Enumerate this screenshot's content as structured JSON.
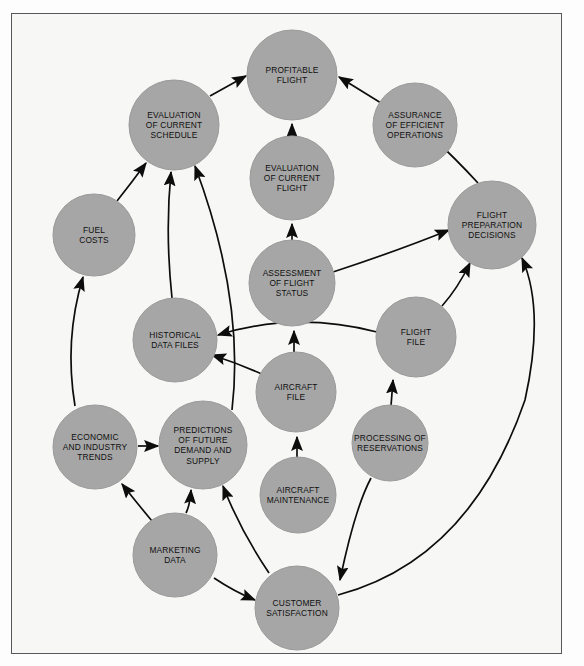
{
  "diagram": {
    "style": {
      "page_background": "#ffffff",
      "frame_background": "#f7f7f5",
      "frame_border": "#58585a",
      "node_fill": "#a6a6a6",
      "node_stroke": "#9a9a9a",
      "arrow_color": "#0d0d0d",
      "label_color": "#101010"
    },
    "nodes": [
      {
        "id": "profitable-flight",
        "label": "PROFITABLE\nFLIGHT",
        "cx": 292,
        "cy": 75,
        "r": 45
      },
      {
        "id": "evaluation-of-current-schedule",
        "label": "EVALUATION\nOF CURRENT\nSCHEDULE",
        "cx": 174,
        "cy": 125,
        "r": 45
      },
      {
        "id": "assurance-of-efficient-operations",
        "label": "ASSURANCE\nOF EFFICIENT\nOPERATIONS",
        "cx": 415,
        "cy": 125,
        "r": 42
      },
      {
        "id": "evaluation-of-current-flight",
        "label": "EVALUATION\nOF CURRENT\nFLIGHT",
        "cx": 292,
        "cy": 178,
        "r": 42
      },
      {
        "id": "fuel-costs",
        "label": "FUEL\nCOSTS",
        "cx": 94,
        "cy": 235,
        "r": 41
      },
      {
        "id": "flight-preparation-decisions",
        "label": "FLIGHT\nPREPARATION\nDECISIONS",
        "cx": 492,
        "cy": 225,
        "r": 44
      },
      {
        "id": "assessment-of-flight-status",
        "label": "ASSESSMENT\nOF FLIGHT\nSTATUS",
        "cx": 292,
        "cy": 283,
        "r": 43
      },
      {
        "id": "historical-data-files",
        "label": "HISTORICAL\nDATA FILES",
        "cx": 175,
        "cy": 340,
        "r": 42
      },
      {
        "id": "flight-file",
        "label": "FLIGHT\nFILE",
        "cx": 416,
        "cy": 337,
        "r": 40
      },
      {
        "id": "aircraft-file",
        "label": "AIRCRAFT\nFILE",
        "cx": 296,
        "cy": 392,
        "r": 40
      },
      {
        "id": "economic-and-industry-trends",
        "label": "ECONOMIC\nAND INDUSTRY\nTRENDS",
        "cx": 95,
        "cy": 447,
        "r": 42
      },
      {
        "id": "predictions-of-future-demand-and-supply",
        "label": "PREDICTIONS\nOF FUTURE\nDEMAND AND\nSUPPLY",
        "cx": 203,
        "cy": 445,
        "r": 44
      },
      {
        "id": "processing-of-reservations",
        "label": "PROCESSING OF\nRESERVATIONS",
        "cx": 390,
        "cy": 443,
        "r": 38
      },
      {
        "id": "aircraft-maintenance",
        "label": "AIRCRAFT\nMAINTENANCE",
        "cx": 298,
        "cy": 495,
        "r": 38
      },
      {
        "id": "marketing-data",
        "label": "MARKETING\nDATA",
        "cx": 175,
        "cy": 555,
        "r": 42
      },
      {
        "id": "customer-satisfaction",
        "label": "CUSTOMER\nSATISFACTION",
        "cx": 297,
        "cy": 608,
        "r": 42
      }
    ],
    "edges": [
      {
        "from": "evaluation-of-current-schedule",
        "to": "profitable-flight",
        "path": "M 210 96 Q 228 86 246 76"
      },
      {
        "from": "assurance-of-efficient-operations",
        "to": "profitable-flight",
        "path": "M 381 103 Q 360 90 339 77"
      },
      {
        "from": "evaluation-of-current-flight",
        "to": "profitable-flight",
        "path": "M 292 136 L 292 124"
      },
      {
        "from": "assessment-of-flight-status",
        "to": "evaluation-of-current-flight",
        "path": "M 292 240 L 292 224"
      },
      {
        "from": "fuel-costs",
        "to": "evaluation-of-current-schedule",
        "path": "M 117 201 Q 132 182 146 163"
      },
      {
        "from": "historical-data-files",
        "to": "evaluation-of-current-schedule",
        "path": "M 172 298 Q 165 232 171 172"
      },
      {
        "from": "predictions-of-future-demand-and-supply",
        "to": "evaluation-of-current-schedule",
        "path": "M 232 410 Q 245 300 195 166"
      },
      {
        "from": "assessment-of-flight-status",
        "to": "flight-preparation-decisions",
        "path": "M 333 272 Q 400 250 449 230"
      },
      {
        "from": "flight-preparation-decisions",
        "to": "assurance-of-efficient-operations",
        "path": "M 478 183 Q 455 158 432 137"
      },
      {
        "from": "flight-file",
        "to": "flight-preparation-decisions",
        "path": "M 442 306 Q 458 288 470 263"
      },
      {
        "from": "flight-file",
        "to": "historical-data-files",
        "path": "M 377 332 Q 295 311 218 335"
      },
      {
        "from": "aircraft-file",
        "to": "historical-data-files",
        "path": "M 266 376 Q 240 364 212 355"
      },
      {
        "from": "aircraft-file",
        "to": "assessment-of-flight-status",
        "path": "M 294 352 L 294 331"
      },
      {
        "from": "economic-and-industry-trends",
        "to": "fuel-costs",
        "path": "M 75 406 Q 64 340 83 277"
      },
      {
        "from": "economic-and-industry-trends",
        "to": "predictions-of-future-demand-and-supply",
        "path": "M 138 446 L 158 446"
      },
      {
        "from": "marketing-data",
        "to": "economic-and-industry-trends",
        "path": "M 152 521 Q 137 503 122 484"
      },
      {
        "from": "marketing-data",
        "to": "predictions-of-future-demand-and-supply",
        "path": "M 186 513 Q 190 505 191 490"
      },
      {
        "from": "marketing-data",
        "to": "customer-satisfaction",
        "path": "M 214 578 Q 235 592 255 600"
      },
      {
        "from": "customer-satisfaction",
        "to": "predictions-of-future-demand-and-supply",
        "path": "M 269 573 Q 240 530 223 486"
      },
      {
        "from": "aircraft-maintenance",
        "to": "aircraft-file",
        "path": "M 297 460 L 297 437"
      },
      {
        "from": "processing-of-reservations",
        "to": "flight-file",
        "path": "M 391 406 L 393 380"
      },
      {
        "from": "processing-of-reservations",
        "to": "customer-satisfaction",
        "path": "M 371 478 Q 355 508 340 580"
      },
      {
        "from": "customer-satisfaction",
        "to": "flight-preparation-decisions",
        "path": "M 338 595 Q 470 560 525 400 Q 545 310 522 258"
      }
    ]
  }
}
